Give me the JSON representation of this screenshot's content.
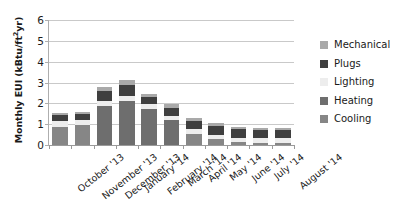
{
  "chart_data": {
    "type": "bar",
    "subtype": "stacked-column",
    "title": "",
    "xlabel": "",
    "ylabel": "Monthly EUI (kBtu/ft²yr)",
    "ylabel_parts": {
      "main": "Monthly EUI (kBtu/ft",
      "sup": "2",
      "tail": "yr)"
    },
    "ylim": [
      0,
      6
    ],
    "ytick_values": [
      0,
      1,
      2,
      3,
      4,
      5,
      6
    ],
    "ytick_labels": [
      "0",
      "1",
      "2",
      "3",
      "4",
      "5",
      "6"
    ],
    "grid": true,
    "grid_axis": "y",
    "legend_position": "right",
    "categories": [
      "October '13",
      "November '13",
      "December '13",
      "January '14",
      "February '14",
      "March '14",
      "April '14",
      "May '14",
      "June '14",
      "July '14",
      "August '14"
    ],
    "stack_order_bottom_to_top": [
      "Cooling",
      "Heating",
      "Lighting",
      "Plugs",
      "Mechanical"
    ],
    "series": [
      {
        "name": "Cooling",
        "color": "#868686",
        "values": [
          0.85,
          0.95,
          0.0,
          0.0,
          0.0,
          0.0,
          0.55,
          0.3,
          0.15,
          0.12,
          0.12
        ]
      },
      {
        "name": "Heating",
        "color": "#6e6e6e",
        "values": [
          0.0,
          0.0,
          1.85,
          2.1,
          1.75,
          1.2,
          0.0,
          0.0,
          0.0,
          0.0,
          0.0
        ]
      },
      {
        "name": "Lighting",
        "color": "#ededed",
        "values": [
          0.3,
          0.25,
          0.25,
          0.25,
          0.2,
          0.2,
          0.2,
          0.2,
          0.2,
          0.2,
          0.2
        ]
      },
      {
        "name": "Plugs",
        "color": "#3f3f3f",
        "values": [
          0.3,
          0.3,
          0.5,
          0.55,
          0.35,
          0.4,
          0.4,
          0.4,
          0.4,
          0.38,
          0.38
        ]
      },
      {
        "name": "Mechanical",
        "color": "#a9a9a9",
        "values": [
          0.1,
          0.1,
          0.2,
          0.2,
          0.15,
          0.15,
          0.15,
          0.15,
          0.1,
          0.1,
          0.1
        ]
      }
    ],
    "totals": [
      1.55,
      1.6,
      2.8,
      3.1,
      2.45,
      1.95,
      1.3,
      1.05,
      0.85,
      0.8,
      0.8
    ]
  },
  "legend": {
    "items": [
      {
        "label": "Mechanical",
        "color": "#a9a9a9"
      },
      {
        "label": "Plugs",
        "color": "#3f3f3f"
      },
      {
        "label": "Lighting",
        "color": "#ededed"
      },
      {
        "label": "Heating",
        "color": "#6e6e6e"
      },
      {
        "label": "Cooling",
        "color": "#868686"
      }
    ]
  },
  "colors": {
    "gridline": "#c9c9c9",
    "axis": "#9a9a9a",
    "text": "#1a1a1a",
    "background": "#ffffff"
  }
}
